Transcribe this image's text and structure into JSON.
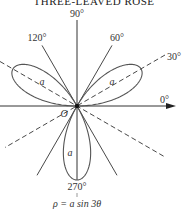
{
  "title": "THREE-LEAVED ROSE",
  "equation": "ρ = a sin 3θ",
  "origin_label": "O",
  "radius_label": "a",
  "angle_labels": {
    "deg90": "90°",
    "deg120": "120°",
    "deg60": "60°",
    "deg30": "30°",
    "deg0": "0°",
    "deg270": "270°"
  },
  "colors": {
    "curve": "#555555",
    "lines": "#333333"
  }
}
